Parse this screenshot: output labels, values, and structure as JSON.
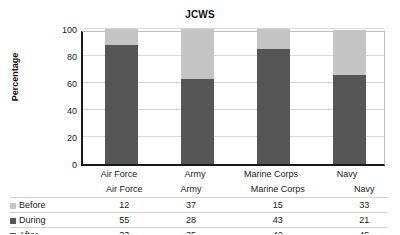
{
  "chart_data": {
    "type": "bar",
    "subtype": "stacked-column-100",
    "title": "JCWS",
    "xlabel": "",
    "ylabel": "Percentage",
    "ylim": [
      0,
      100
    ],
    "yticks": [
      0,
      20,
      40,
      60,
      80,
      100
    ],
    "grid": true,
    "legend_position": "data-table-below",
    "categories": [
      "Air Force",
      "Army",
      "Marine Corps",
      "Navy"
    ],
    "stack_order_top_to_bottom": [
      "Before",
      "During",
      "After"
    ],
    "series": [
      {
        "name": "Before",
        "values": [
          12,
          37,
          15,
          33
        ],
        "color": "#c4c4c4"
      },
      {
        "name": "During",
        "values": [
          55,
          28,
          43,
          21
        ],
        "color": "#565656"
      },
      {
        "name": "After",
        "values": [
          33,
          35,
          42,
          45
        ],
        "color": "#565656"
      }
    ]
  },
  "table": {
    "column_headers": [
      "Air Force",
      "Army",
      "Marine Corps",
      "Navy"
    ],
    "rows": [
      {
        "label": "Before",
        "swatch": "#c4c4c4",
        "values": [
          "12",
          "37",
          "15",
          "33"
        ]
      },
      {
        "label": "During",
        "swatch": "#565656",
        "values": [
          "55",
          "28",
          "43",
          "21"
        ]
      },
      {
        "label": "After",
        "swatch": "#565656",
        "values": [
          "33",
          "35",
          "42",
          "45"
        ]
      }
    ]
  },
  "axis": {
    "y_tick_labels": [
      "100",
      "80",
      "60",
      "40",
      "20",
      "0"
    ]
  }
}
